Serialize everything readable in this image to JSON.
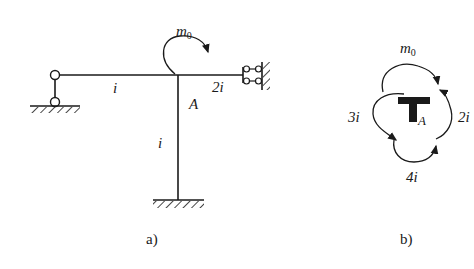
{
  "figure_a": {
    "caption": "a)",
    "moment_label": "m",
    "moment_sub": "0",
    "left_beam_stiffness": "i",
    "right_beam_stiffness": "2i",
    "column_stiffness": "i",
    "joint_label": "A",
    "supports": {
      "left": "pinned-link (two-hinge bar) to ground",
      "right": "sliding/roller guide at wall",
      "bottom": "fixed"
    }
  },
  "figure_b": {
    "caption": "b)",
    "moment_label": "m",
    "moment_sub": "0",
    "left_moment": "3i",
    "right_moment": "2i",
    "bottom_moment": "4i",
    "joint_label": "A"
  },
  "colors": {
    "line": "#1a1a1a",
    "background": "#ffffff"
  }
}
